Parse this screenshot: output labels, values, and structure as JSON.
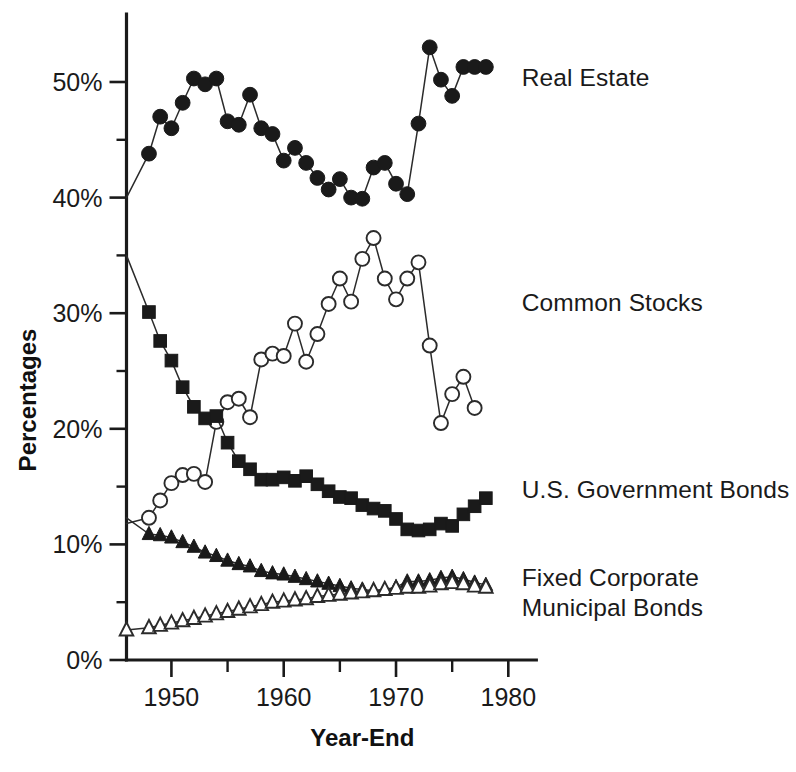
{
  "chart_data": {
    "type": "line",
    "title": "",
    "xlabel": "Year-End",
    "ylabel": "Percentages",
    "xlim": [
      1946,
      1980
    ],
    "ylim": [
      0,
      55
    ],
    "grid": false,
    "legend_position": "right-inline-labels",
    "x_ticks_major": [
      1950,
      1960,
      1970,
      1980
    ],
    "x_tick_labels": [
      "1950",
      "1960",
      "1970",
      "1980"
    ],
    "x_ticks_minor": [
      1955,
      1965,
      1975
    ],
    "y_ticks_major": [
      0,
      10,
      20,
      30,
      40,
      50
    ],
    "y_tick_labels": [
      "0%",
      "10%",
      "20%",
      "30%",
      "40%",
      "50%"
    ],
    "y_ticks_minor": [
      5,
      15,
      25,
      35,
      45
    ],
    "series": [
      {
        "name": "Real Estate",
        "marker": "filled-circle",
        "label_x": 1981.2,
        "label_y": 50.3,
        "x": [
          1946,
          1948,
          1949,
          1950,
          1951,
          1952,
          1953,
          1954,
          1955,
          1956,
          1957,
          1958,
          1959,
          1960,
          1961,
          1962,
          1963,
          1964,
          1965,
          1966,
          1967,
          1968,
          1969,
          1970,
          1971,
          1972,
          1973,
          1974,
          1975,
          1976,
          1977,
          1978
        ],
        "values": [
          40.0,
          43.8,
          47.0,
          46.0,
          48.2,
          50.3,
          49.8,
          50.3,
          46.6,
          46.3,
          48.9,
          46.0,
          45.5,
          43.2,
          44.3,
          43.0,
          41.7,
          40.7,
          41.6,
          40.0,
          39.9,
          42.6,
          43.0,
          41.2,
          40.3,
          46.4,
          53.0,
          50.2,
          48.8,
          51.3,
          51.3,
          51.3
        ]
      },
      {
        "name": "Common Stocks",
        "marker": "open-circle",
        "label_x": 1981.2,
        "label_y": 30.8,
        "x": [
          1946,
          1948,
          1949,
          1950,
          1951,
          1952,
          1953,
          1954,
          1955,
          1956,
          1957,
          1958,
          1959,
          1960,
          1961,
          1962,
          1963,
          1964,
          1965,
          1966,
          1967,
          1968,
          1969,
          1970,
          1971,
          1972,
          1973,
          1974,
          1975,
          1976,
          1977
        ],
        "values": [
          11.8,
          12.3,
          13.8,
          15.3,
          16.0,
          16.1,
          15.4,
          20.6,
          22.3,
          22.6,
          21.0,
          26.0,
          26.5,
          26.3,
          29.1,
          25.8,
          28.2,
          30.8,
          33.0,
          31.0,
          34.7,
          36.5,
          33.0,
          31.2,
          33.0,
          34.4,
          27.2,
          20.5,
          23.0,
          24.5,
          21.8
        ]
      },
      {
        "name": "U.S. Government Bonds",
        "marker": "filled-square",
        "label_x": 1981.2,
        "label_y": 14.6,
        "x": [
          1946,
          1948,
          1949,
          1950,
          1951,
          1952,
          1953,
          1954,
          1955,
          1956,
          1957,
          1958,
          1959,
          1960,
          1961,
          1962,
          1963,
          1964,
          1965,
          1966,
          1967,
          1968,
          1969,
          1970,
          1971,
          1972,
          1973,
          1974,
          1975,
          1976,
          1977,
          1978
        ],
        "values": [
          35.0,
          30.1,
          27.6,
          25.9,
          23.6,
          21.9,
          20.9,
          21.1,
          18.8,
          17.2,
          16.5,
          15.6,
          15.6,
          15.8,
          15.5,
          15.9,
          15.2,
          14.6,
          14.1,
          14.0,
          13.4,
          13.1,
          12.9,
          12.2,
          11.3,
          11.2,
          11.3,
          11.8,
          11.6,
          12.6,
          13.3,
          14.0
        ]
      },
      {
        "name": "Fixed Corporate",
        "marker": "filled-triangle",
        "label_x": 1981.2,
        "label_y": 7.0,
        "x": [
          1946,
          1948,
          1949,
          1950,
          1951,
          1952,
          1953,
          1954,
          1955,
          1956,
          1957,
          1958,
          1959,
          1960,
          1961,
          1962,
          1963,
          1964,
          1965,
          1966,
          1967,
          1968,
          1969,
          1970,
          1971,
          1972,
          1973,
          1974,
          1975,
          1976,
          1977,
          1978
        ],
        "values": [
          12.3,
          10.9,
          10.8,
          10.6,
          10.2,
          9.8,
          9.3,
          9.0,
          8.6,
          8.3,
          8.1,
          7.7,
          7.5,
          7.4,
          7.2,
          7.0,
          6.8,
          6.6,
          6.4,
          6.2,
          6.1,
          6.0,
          6.1,
          6.3,
          6.8,
          6.8,
          6.9,
          7.1,
          7.2,
          7.0,
          6.7,
          6.5
        ]
      },
      {
        "name": "Municipal Bonds",
        "marker": "open-triangle",
        "label_x": 1981.2,
        "label_y": 4.4,
        "x": [
          1946,
          1948,
          1949,
          1950,
          1951,
          1952,
          1953,
          1954,
          1955,
          1956,
          1957,
          1958,
          1959,
          1960,
          1961,
          1962,
          1963,
          1964,
          1965,
          1966,
          1967,
          1968,
          1969,
          1970,
          1971,
          1972,
          1973,
          1974,
          1975,
          1976,
          1977,
          1978
        ],
        "values": [
          2.6,
          2.8,
          3.0,
          3.2,
          3.4,
          3.6,
          3.8,
          4.0,
          4.2,
          4.4,
          4.6,
          4.8,
          5.0,
          5.1,
          5.2,
          5.3,
          5.5,
          5.6,
          5.7,
          5.8,
          5.9,
          6.0,
          6.1,
          6.2,
          6.3,
          6.3,
          6.4,
          6.6,
          6.7,
          6.6,
          6.4,
          6.3
        ]
      }
    ]
  },
  "labels": {
    "real_estate": "Real Estate",
    "common_stocks": "Common Stocks",
    "gov_bonds": "U.S. Government Bonds",
    "fixed_corporate": "Fixed Corporate",
    "municipal_bonds": "Municipal Bonds",
    "x_axis_title": "Year-End",
    "y_axis_title": "Percentages"
  },
  "colors": {
    "ink": "#1a1a1a",
    "line": "#2b2b2b",
    "background": "#ffffff"
  }
}
